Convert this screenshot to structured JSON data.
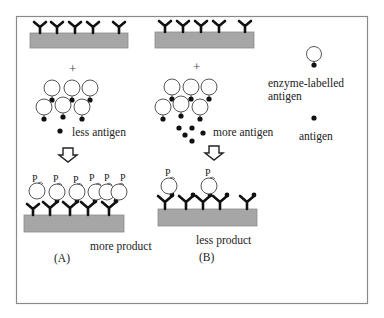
{
  "diagram": {
    "plus_symbol": "+",
    "panel_a": {
      "label": "(A)",
      "antigen_amount_label": "less antigen",
      "result_label": "more product"
    },
    "panel_b": {
      "label": "(B)",
      "antigen_amount_label": "more antigen",
      "result_label": "less product"
    },
    "product_symbol": "P",
    "legend": {
      "enzyme_labelled_antigen_line1": "enzyme-labelled",
      "enzyme_labelled_antigen_line2": "antigen",
      "antigen": "antigen"
    },
    "colors": {
      "substrate": "#a6a6a6",
      "antibody": "#111111",
      "frame": "#8a8a8a"
    }
  }
}
